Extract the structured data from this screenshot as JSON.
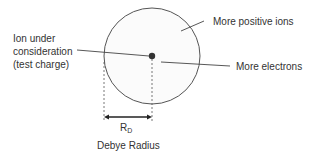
{
  "diagram": {
    "labels": {
      "ion_line1": "Ion under",
      "ion_line2": "consideration",
      "ion_line3": "(test charge)",
      "positive_ions": "More positive ions",
      "electrons": "More electrons",
      "radius_symbol": "R",
      "radius_subscript": "D",
      "radius_caption": "Debye Radius"
    },
    "colors": {
      "line": "#444444",
      "text": "#333333",
      "dot": "#333333",
      "circle_fill": "#fbfbfb"
    }
  }
}
